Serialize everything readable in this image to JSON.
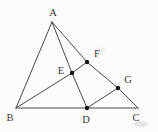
{
  "figure": {
    "type": "geometry-diagram",
    "width": 158,
    "height": 132,
    "colors": {
      "background": "#fbfbfa",
      "line": "#4a4a4a",
      "dot": "#151515",
      "label": "#3a3a3a"
    },
    "points": [
      {
        "id": "A",
        "label": "A",
        "x": 52,
        "y": 22,
        "dot": false,
        "label_x": 53,
        "label_y": 12
      },
      {
        "id": "B",
        "label": "B",
        "x": 16,
        "y": 108,
        "dot": false,
        "label_x": 10,
        "label_y": 117
      },
      {
        "id": "C",
        "label": "C",
        "x": 138,
        "y": 108,
        "dot": false,
        "label_x": 136,
        "label_y": 117
      },
      {
        "id": "D",
        "label": "D",
        "x": 87,
        "y": 108,
        "dot": true,
        "label_x": 86,
        "label_y": 119
      },
      {
        "id": "E",
        "label": "E",
        "x": 72,
        "y": 73,
        "dot": true,
        "label_x": 61,
        "label_y": 70
      },
      {
        "id": "F",
        "label": "F",
        "x": 87,
        "y": 62,
        "dot": true,
        "label_x": 97,
        "label_y": 53
      },
      {
        "id": "G",
        "label": "G",
        "x": 118,
        "y": 88,
        "dot": true,
        "label_x": 128,
        "label_y": 79
      }
    ],
    "segments": [
      {
        "name": "AB",
        "through": [
          "A",
          "B"
        ]
      },
      {
        "name": "BC",
        "through": [
          "B",
          "C"
        ]
      },
      {
        "name": "AC",
        "through": [
          "A",
          "F",
          "G",
          "C"
        ]
      },
      {
        "name": "AD",
        "through": [
          "A",
          "E",
          "D"
        ]
      },
      {
        "name": "BF",
        "through": [
          "B",
          "E",
          "F"
        ]
      },
      {
        "name": "DG",
        "through": [
          "D",
          "G"
        ]
      }
    ],
    "dot_radius": 2.2,
    "line_width": 1
  }
}
